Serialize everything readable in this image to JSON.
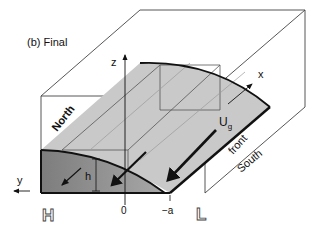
{
  "figure": {
    "panel_label": "(b) Final",
    "axes": {
      "z": "z",
      "x": "x",
      "y": "y"
    },
    "labels": {
      "north": "North",
      "south": "South",
      "front": "front",
      "velocity_main": "U",
      "velocity_sub": "g",
      "height": "h",
      "tick_zero": "0",
      "tick_minus_a": "−a",
      "high": "H",
      "low": "L"
    },
    "colors": {
      "surface_light": "#c9c9c9",
      "slab_dark": "#8f8f8f",
      "outline": "#111111",
      "box_line": "#444444"
    }
  }
}
